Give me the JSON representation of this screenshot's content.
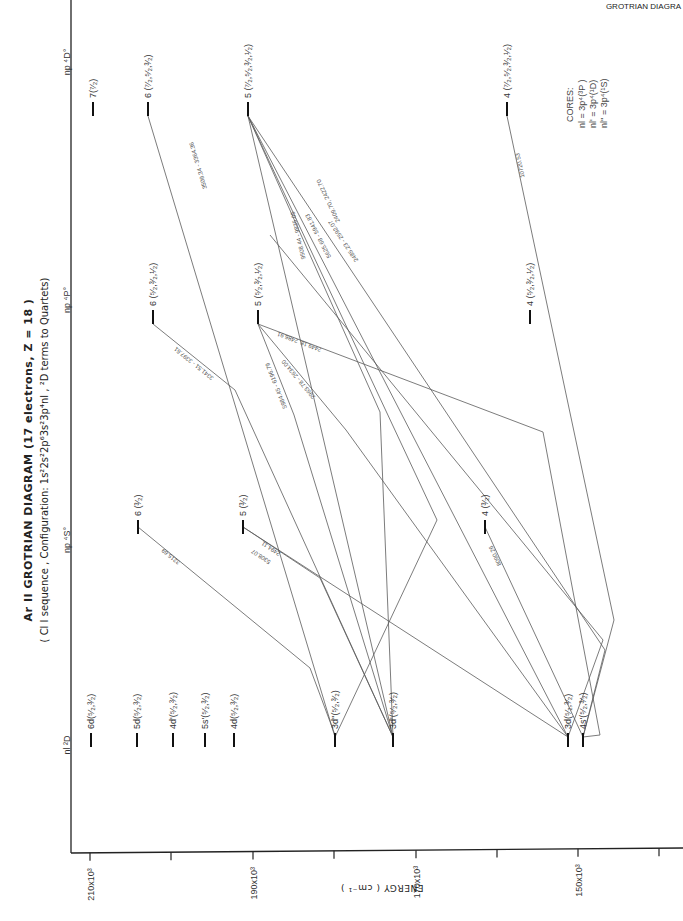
{
  "header": {
    "corner_text": "GROTRIAN DIAGRA",
    "title": "Ar II  GROTRIAN  DIAGRAM  (17 electrons, Z = 18 )",
    "subtitle": "( Cl I sequence , Configuration: 1s²2s²2p⁶3s²3p⁴nl , ²D terms to Quartets)"
  },
  "axis": {
    "title": "ENERGY  ( cm⁻¹ )",
    "ticks": [
      {
        "value": 210000,
        "label": "210x10³",
        "x": 90,
        "labeled": true
      },
      {
        "value": 200000,
        "label": "",
        "x": 171,
        "labeled": false
      },
      {
        "value": 190000,
        "label": "190x10³",
        "x": 253,
        "labeled": true
      },
      {
        "value": 180000,
        "label": "",
        "x": 334,
        "labeled": false
      },
      {
        "value": 170000,
        "label": "170x10³",
        "x": 416,
        "labeled": true
      },
      {
        "value": 160000,
        "label": "",
        "x": 497,
        "labeled": false
      },
      {
        "value": 150000,
        "label": "150x10³",
        "x": 578,
        "labeled": true
      },
      {
        "value": 140000,
        "label": "",
        "x": 659,
        "labeled": false
      }
    ]
  },
  "columns": [
    {
      "id": "nl2D",
      "label": "nl ²D",
      "y": 745
    },
    {
      "id": "np4S",
      "label": "np ⁴S°",
      "y": 540
    },
    {
      "id": "np4P",
      "label": "np ⁴P°",
      "y": 300
    },
    {
      "id": "np4D",
      "label": "np ⁴D°",
      "y": 62
    }
  ],
  "levels": [
    {
      "id": "6d",
      "col": "nl2D",
      "label": "6d(⁵⁄₂,³⁄₂)",
      "x": 91,
      "y": 745
    },
    {
      "id": "5d",
      "col": "nl2D",
      "label": "5d(⁵⁄₂,³⁄₂)",
      "x": 137,
      "y": 745
    },
    {
      "id": "4dp",
      "col": "nl2D",
      "label": "4d'(⁵⁄₂,³⁄₂)",
      "x": 173,
      "y": 745
    },
    {
      "id": "5sp",
      "col": "nl2D",
      "label": "5s'(⁵⁄₂,³⁄₂)",
      "x": 205,
      "y": 745
    },
    {
      "id": "4d",
      "col": "nl2D",
      "label": "4d(⁵⁄₂,³⁄₂)",
      "x": 234,
      "y": 745
    },
    {
      "id": "3dpp",
      "col": "nl2D",
      "label": "3d''(⁵⁄₂,³⁄₂)",
      "x": 335,
      "y": 745
    },
    {
      "id": "3dp",
      "col": "nl2D",
      "label": "3d'(⁵⁄₂,³⁄₂)",
      "x": 393,
      "y": 745
    },
    {
      "id": "3d",
      "col": "nl2D",
      "label": "3d(⁵⁄₂,³⁄₂)",
      "x": 568,
      "y": 745
    },
    {
      "id": "4sp",
      "col": "nl2D",
      "label": "4s'(⁵⁄₂,³⁄₂)",
      "x": 583,
      "y": 745
    },
    {
      "id": "S6",
      "col": "np4S",
      "label": "6 (³⁄₂)",
      "x": 138,
      "y": 530
    },
    {
      "id": "S5",
      "col": "np4S",
      "label": "5 (³⁄₂)",
      "x": 243,
      "y": 530
    },
    {
      "id": "S4",
      "col": "np4S",
      "label": "4 (³⁄₂)",
      "x": 485,
      "y": 530
    },
    {
      "id": "P6",
      "col": "np4P",
      "label": "6 (⁵⁄₂,³⁄₂,¹⁄₂)",
      "x": 153,
      "y": 320
    },
    {
      "id": "P5",
      "col": "np4P",
      "label": "5 (⁵⁄₂,³⁄₂,¹⁄₂)",
      "x": 258,
      "y": 320
    },
    {
      "id": "P4",
      "col": "np4P",
      "label": "4 (⁵⁄₂,³⁄₂,¹⁄₂)",
      "x": 530,
      "y": 320
    },
    {
      "id": "D7",
      "col": "np4D",
      "label": "7(⁷⁄₂)",
      "x": 93,
      "y": 112
    },
    {
      "id": "D6",
      "col": "np4D",
      "label": "6 (⁷⁄₂,⁵⁄₂,³⁄₂)",
      "x": 148,
      "y": 112
    },
    {
      "id": "D5",
      "col": "np4D",
      "label": "5 (⁷⁄₂,⁵⁄₂,³⁄₂,¹⁄₂)",
      "x": 248,
      "y": 112
    },
    {
      "id": "D4",
      "col": "np4D",
      "label": "4 (⁷⁄₂,⁵⁄₂,³⁄₂,¹⁄₂)",
      "x": 507,
      "y": 112
    }
  ],
  "transitions": [
    {
      "from": "S6",
      "to": "3dpp",
      "label": "3215.69",
      "points": [
        [
          138,
          527
        ],
        [
          310,
          668
        ],
        [
          335,
          735
        ]
      ],
      "lx": 172,
      "ly": 555
    },
    {
      "from": "S5",
      "to": "3dp",
      "label": "2494.11",
      "points": [
        [
          243,
          527
        ],
        [
          320,
          578
        ],
        [
          393,
          737
        ]
      ],
      "lx": 272,
      "ly": 547
    },
    {
      "from": "S5",
      "to": "3d",
      "label": "5308.07",
      "points": [
        [
          243,
          527
        ],
        [
          568,
          737
        ]
      ],
      "lx": 262,
      "ly": 555
    },
    {
      "from": "S4",
      "to": "4sp",
      "label": "8090.26",
      "points": [
        [
          485,
          527
        ],
        [
          583,
          737
        ]
      ],
      "lx": 497,
      "ly": 555
    },
    {
      "from": "P6",
      "to": "3dp",
      "label": "3341.51 - 3397.61",
      "points": [
        [
          153,
          324
        ],
        [
          235,
          390
        ],
        [
          393,
          737
        ]
      ],
      "lx": 195,
      "ly": 362
    },
    {
      "from": "P5",
      "to": "3dpp",
      "label": "2449.18, 2486.91",
      "points": [
        [
          258,
          324
        ],
        [
          543,
          432
        ],
        [
          600,
          735
        ],
        [
          583,
          737
        ]
      ],
      "lx": 300,
      "ly": 340
    },
    {
      "from": "P5",
      "to": "3dp",
      "label": "5984.45 - 6196.79",
      "points": [
        [
          258,
          324
        ],
        [
          294,
          415
        ],
        [
          393,
          737
        ]
      ],
      "lx": 278,
      "ly": 385
    },
    {
      "from": "P5",
      "to": "3d",
      "label": "2963.78 - 2634.00",
      "points": [
        [
          258,
          324
        ],
        [
          346,
          430
        ],
        [
          568,
          737
        ]
      ],
      "lx": 300,
      "ly": 378
    },
    {
      "from": "D6",
      "to": "3dpp",
      "label": "3509.34 - 3364.36",
      "points": [
        [
          148,
          116
        ],
        [
          335,
          737
        ]
      ],
      "lx": 200,
      "ly": 165
    },
    {
      "from": "D5",
      "to": "3dp",
      "label": "9508.44 - 9835.05",
      "points": [
        [
          248,
          116
        ],
        [
          393,
          737
        ]
      ],
      "lx": 300,
      "ly": 235
    },
    {
      "from": "D5",
      "to": "3d",
      "label": "5625.68 - 5941.83",
      "points": [
        [
          248,
          116
        ],
        [
          568,
          737
        ]
      ],
      "lx": 320,
      "ly": 235
    },
    {
      "from": "D5",
      "to": "4sp",
      "label": "2485.23 - 2592.07",
      "points": [
        [
          248,
          116
        ],
        [
          605,
          650
        ],
        [
          583,
          737
        ]
      ],
      "lx": 345,
      "ly": 240
    },
    {
      "from": "D5",
      "to": "3dpp",
      "label": "2409.70, 2422.70",
      "points": [
        [
          248,
          116
        ],
        [
          437,
          520
        ],
        [
          335,
          737
        ]
      ],
      "lx": 330,
      "ly": 200
    },
    {
      "from": "D5",
      "to": "3dp2",
      "label": "",
      "points": [
        [
          248,
          116
        ],
        [
          380,
          412
        ],
        [
          393,
          737
        ]
      ],
      "lx": 0,
      "ly": 0
    },
    {
      "from": "D4",
      "to": "4sp",
      "label": "10720.53",
      "points": [
        [
          507,
          116
        ],
        [
          614,
          620
        ],
        [
          583,
          737
        ]
      ],
      "lx": 522,
      "ly": 165
    },
    {
      "from": "D4b",
      "to": "3d",
      "label": "",
      "points": [
        [
          270,
          235
        ],
        [
          603,
          640
        ],
        [
          568,
          737
        ]
      ],
      "lx": 0,
      "ly": 0
    }
  ],
  "cores": {
    "title": "CORES:",
    "lines": [
      "nl = 3p⁴(³P )",
      "nl' = 3p⁴(¹D)",
      "nl'' = 3p⁴(¹S)"
    ]
  }
}
